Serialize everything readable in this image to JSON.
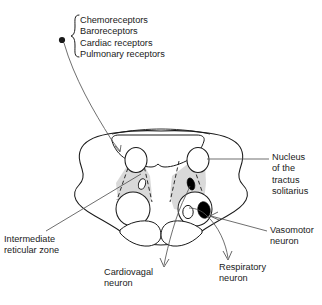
{
  "figure": {
    "colors": {
      "stroke": "#1a1a1a",
      "background": "#ffffff",
      "shaded_zone": "#d9d9d9",
      "filled_nucleus": "#000000",
      "leader_line": "#555555"
    }
  },
  "receptor_list": {
    "name": "afferent-receptor-list",
    "bracket": "left-curly-brace",
    "items": [
      "Chemoreceptors",
      "Baroreceptors",
      "Cardiac receptors",
      "Pulmonary receptors"
    ]
  },
  "labels": {
    "nucleus_tractus_solitarius": {
      "lines": [
        "Nucleus",
        "of the",
        "tractus",
        "solitarius"
      ],
      "connector": "line"
    },
    "vasomotor_neuron": {
      "lines": [
        "Vasomotor",
        "neuron"
      ],
      "connector": "arrow"
    },
    "intermediate_reticular_zone": {
      "lines": [
        "Intermediate",
        "reticular zone"
      ],
      "connector": "line"
    },
    "cardiovagal_neuron": {
      "lines": [
        "Cardiovagal",
        "neuron"
      ],
      "connector": "arrow"
    },
    "respiratory_neuron": {
      "lines": [
        "Respiratory",
        "neuron"
      ],
      "connector": "arrow"
    }
  },
  "structures": [
    {
      "name": "brainstem-outline",
      "kind": "outline",
      "side": "bilateral"
    },
    {
      "name": "fourth-ventricle",
      "kind": "cavity",
      "side": "midline"
    },
    {
      "name": "nts-oval-left",
      "kind": "open-oval",
      "side": "left"
    },
    {
      "name": "nts-oval-right",
      "kind": "open-oval",
      "side": "right"
    },
    {
      "name": "intermediate-reticular-zone-left",
      "kind": "shaded-wedge",
      "side": "left"
    },
    {
      "name": "intermediate-reticular-zone-right",
      "kind": "shaded-wedge",
      "side": "right"
    },
    {
      "name": "inferior-olive-left",
      "kind": "open-circle",
      "side": "left"
    },
    {
      "name": "inferior-olive-right",
      "kind": "open-circle",
      "side": "right"
    },
    {
      "name": "cardiovagal-nucleus-left",
      "kind": "open-oval",
      "side": "left"
    },
    {
      "name": "respiratory-nucleus-right",
      "kind": "filled-oval",
      "side": "right"
    },
    {
      "name": "vasomotor-nucleus-right",
      "kind": "filled-oval",
      "side": "right"
    },
    {
      "name": "cardiovagal-nucleus-right",
      "kind": "open-oval",
      "side": "right"
    },
    {
      "name": "pyramid-left",
      "kind": "lobe",
      "side": "left"
    },
    {
      "name": "pyramid-right",
      "kind": "lobe",
      "side": "right"
    },
    {
      "name": "afferent-origin-dot",
      "kind": "filled-dot",
      "side": "external"
    }
  ]
}
